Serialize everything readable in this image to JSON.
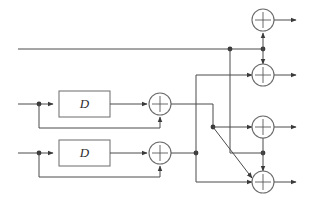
{
  "diagram": {
    "type": "block-diagram",
    "colors": {
      "wire": "#4a4a4a",
      "node": "#3a3a3a",
      "box_stroke": "#6b6b6b",
      "background": "#ffffff",
      "label": "#2e2e2e"
    },
    "delay_blocks": [
      {
        "id": "delay-1",
        "label": "D",
        "x": 59,
        "y": 91,
        "w": 51,
        "h": 26
      },
      {
        "id": "delay-2",
        "label": "D",
        "x": 59,
        "y": 140,
        "w": 51,
        "h": 26
      }
    ],
    "adders": [
      {
        "id": "adder-row1",
        "label": "+",
        "cx": 160,
        "cy": 104,
        "r": 11
      },
      {
        "id": "adder-row2",
        "label": "+",
        "cx": 160,
        "cy": 153,
        "r": 11
      },
      {
        "id": "adder-out1",
        "label": "+",
        "cx": 263,
        "cy": 20,
        "r": 11
      },
      {
        "id": "adder-out2",
        "label": "+",
        "cx": 263,
        "cy": 75,
        "r": 11
      },
      {
        "id": "adder-out3",
        "label": "+",
        "cx": 263,
        "cy": 127,
        "r": 11
      },
      {
        "id": "adder-out4",
        "label": "+",
        "cx": 263,
        "cy": 182,
        "r": 11
      }
    ],
    "inputs": [
      {
        "id": "input-bypass",
        "label": "",
        "x": 18,
        "y": 49
      },
      {
        "id": "input-1",
        "label": "",
        "x": 18,
        "y": 104
      },
      {
        "id": "input-2",
        "label": "",
        "x": 18,
        "y": 153
      }
    ],
    "outputs": [
      {
        "id": "output-1",
        "label": "",
        "x": 296,
        "y": 20
      },
      {
        "id": "output-2",
        "label": "",
        "x": 296,
        "y": 75
      },
      {
        "id": "output-3",
        "label": "",
        "x": 296,
        "y": 127
      },
      {
        "id": "output-4",
        "label": "",
        "x": 296,
        "y": 182
      }
    ],
    "junctions": [
      {
        "id": "junction-tap-1",
        "cx": 39,
        "cy": 104
      },
      {
        "id": "junction-tap-2",
        "cx": 39,
        "cy": 153
      },
      {
        "id": "junction-bypass",
        "cx": 230,
        "cy": 49
      },
      {
        "id": "junction-bus-top",
        "cx": 263,
        "cy": 49
      },
      {
        "id": "junction-mid",
        "cx": 213,
        "cy": 127
      },
      {
        "id": "junction-low",
        "cx": 196,
        "cy": 153
      },
      {
        "id": "junction-cross",
        "cx": 263,
        "cy": 153
      }
    ]
  }
}
